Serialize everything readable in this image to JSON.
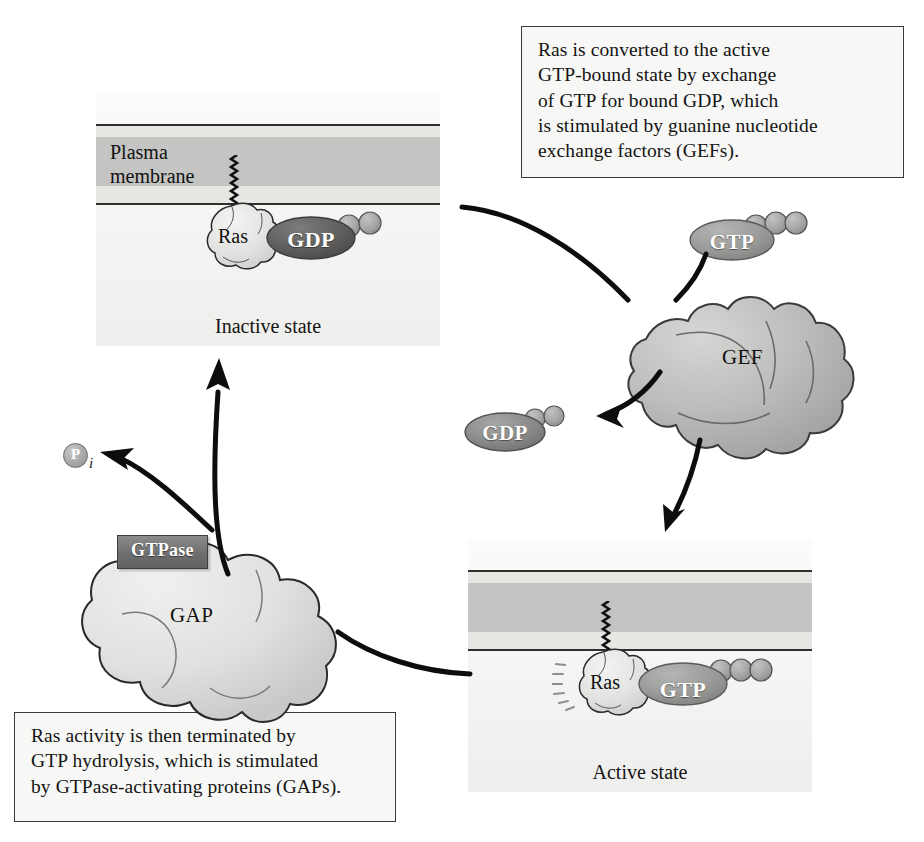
{
  "figure": {
    "colors": {
      "membrane_band": "#c4c4c2",
      "membrane_line": "#2f2f2f",
      "panel_background": "#f4f4f2",
      "gdp_dark": "#5d5d5b",
      "gdp_mid": "#8a8a88",
      "gtp_mid": "#9a9a98",
      "gef_fill": "#b9b9b7",
      "gap_fill": "#dcdcda",
      "ras_fill": "#e2e2e0",
      "gtpase_plaque": "#6f6f6f",
      "arrow": "#0d0d0d"
    }
  },
  "captions": {
    "gef": {
      "lines": [
        "Ras is converted to the active",
        "GTP-bound state by exchange",
        "of GTP for bound GDP, which",
        "is stimulated by guanine nucleotide",
        "exchange factors (GEFs)."
      ]
    },
    "gap": {
      "lines": [
        "Ras activity is then terminated by",
        "GTP hydrolysis, which is stimulated",
        "by GTPase-activating proteins (GAPs)."
      ]
    }
  },
  "panels": {
    "inactive": {
      "membrane_label_line1": "Plasma",
      "membrane_label_line2": "membrane",
      "state_caption": "Inactive state",
      "ras_label": "Ras",
      "nucleotide": "GDP",
      "phosphate_count": 2
    },
    "active": {
      "state_caption": "Active state",
      "ras_label": "Ras",
      "nucleotide": "GTP",
      "phosphate_count": 3
    }
  },
  "proteins": {
    "gef": {
      "label": "GEF"
    },
    "gap": {
      "label": "GAP"
    }
  },
  "molecules": {
    "free_gtp": {
      "label": "GTP",
      "phosphate_count": 3
    },
    "free_gdp": {
      "label": "GDP",
      "phosphate_count": 2
    },
    "inorganic_phosphate": {
      "letter": "P",
      "subscript": "i"
    }
  },
  "enzyme_tag": {
    "label": "GTPase"
  }
}
